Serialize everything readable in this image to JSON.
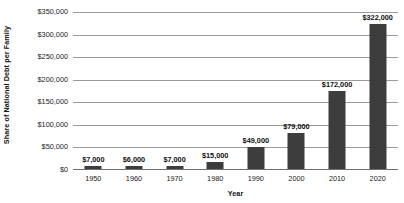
{
  "chart_data": {
    "type": "bar",
    "title": "",
    "xlabel": "Year",
    "ylabel": "Share of National Debt per Family",
    "categories": [
      "1950",
      "1960",
      "1970",
      "1980",
      "1990",
      "2000",
      "2010",
      "2020"
    ],
    "values": [
      7000,
      6000,
      7000,
      15000,
      49000,
      79000,
      172000,
      322000
    ],
    "value_labels": [
      "$7,000",
      "$6,000",
      "$7,000",
      "$15,000",
      "$49,000",
      "$79,000",
      "$172,000",
      "$322,000"
    ],
    "ylim": [
      0,
      350000
    ],
    "ytick_values": [
      350000,
      300000,
      250000,
      200000,
      150000,
      100000,
      50000,
      0
    ],
    "ytick_labels": [
      "$350,000",
      "$300,000",
      "$250,000",
      "$200,000",
      "$150,000",
      "$100,000",
      "$50,000",
      "$0"
    ],
    "grid": true,
    "legend": false,
    "bar_color": "#3d3d3d",
    "gridline_color": "#9a9a9a",
    "background_color": "#ffffff"
  }
}
